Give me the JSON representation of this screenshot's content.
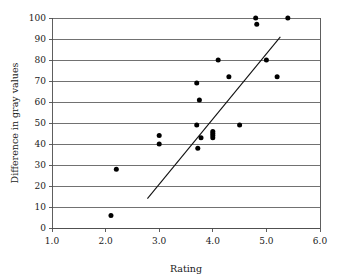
{
  "chart_data": {
    "type": "scatter",
    "title": "",
    "xlabel": "Rating",
    "ylabel": "Difference in gray values",
    "xlim": [
      1.0,
      6.0
    ],
    "ylim": [
      0,
      100
    ],
    "xticks": [
      "1.0",
      "2.0",
      "3.0",
      "4.0",
      "5.0",
      "6.0"
    ],
    "xtick_values": [
      1.0,
      2.0,
      3.0,
      4.0,
      5.0,
      6.0
    ],
    "yticks": [
      "0",
      "10",
      "20",
      "30",
      "40",
      "50",
      "60",
      "70",
      "80",
      "90",
      "100"
    ],
    "ytick_values": [
      0,
      10,
      20,
      30,
      40,
      50,
      60,
      70,
      80,
      90,
      100
    ],
    "grid": "horizontal",
    "legend": "none",
    "marker": "filled-circle",
    "marker_color": "#000000",
    "points": [
      {
        "x": 2.1,
        "y": 6
      },
      {
        "x": 2.2,
        "y": 28
      },
      {
        "x": 3.0,
        "y": 44
      },
      {
        "x": 3.0,
        "y": 40
      },
      {
        "x": 3.7,
        "y": 69
      },
      {
        "x": 3.75,
        "y": 61
      },
      {
        "x": 3.7,
        "y": 49
      },
      {
        "x": 3.78,
        "y": 43
      },
      {
        "x": 3.72,
        "y": 38
      },
      {
        "x": 4.0,
        "y": 46
      },
      {
        "x": 4.0,
        "y": 45
      },
      {
        "x": 4.0,
        "y": 44
      },
      {
        "x": 4.0,
        "y": 43
      },
      {
        "x": 4.1,
        "y": 80
      },
      {
        "x": 4.3,
        "y": 72
      },
      {
        "x": 4.5,
        "y": 49
      },
      {
        "x": 4.8,
        "y": 100
      },
      {
        "x": 4.82,
        "y": 97
      },
      {
        "x": 5.0,
        "y": 80
      },
      {
        "x": 5.2,
        "y": 72
      },
      {
        "x": 5.4,
        "y": 100
      }
    ],
    "trend_line": {
      "type": "linear-fit",
      "x_start": 2.78,
      "y_start": 14,
      "x_end": 5.26,
      "y_end": 91,
      "color": "#111111"
    }
  }
}
